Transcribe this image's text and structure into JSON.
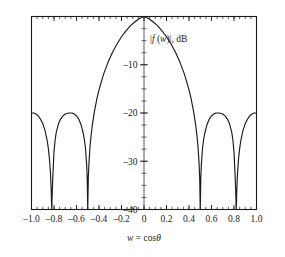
{
  "chart_data": {
    "type": "line",
    "title": "",
    "subtitle": "",
    "xlabel": "w = cosθ",
    "ylabel": "|f (w)|, dB",
    "ylabel_parts": {
      "bar_open": "|",
      "f": "f",
      "paren_open": " (",
      "w": "w",
      "paren_close": ")",
      "bar_close": "|",
      "units": ", dB"
    },
    "xlabel_parts": {
      "var": "w",
      "eq": " = cos",
      "theta": "θ"
    },
    "xlim": [
      -1.0,
      1.0
    ],
    "ylim": [
      -40,
      0
    ],
    "grid": false,
    "legend": null,
    "legend_position": "none",
    "x_ticks": [
      -1.0,
      -0.8,
      -0.6,
      -0.4,
      -0.2,
      0,
      0.2,
      0.4,
      0.6,
      0.8,
      1.0
    ],
    "x_tick_labels": [
      "–1.0",
      "–0.8",
      "–0.6",
      "–0.4",
      "–0.2",
      "0",
      "0.2",
      "0.4",
      "0.6",
      "0.8",
      "1.0"
    ],
    "x_minor_step": 0.05,
    "y_ticks": [
      -10,
      -20,
      -30,
      -40
    ],
    "y_tick_labels": [
      "–10",
      "–20",
      "–30",
      "–40"
    ],
    "y_minor_step": 2.5,
    "series": [
      {
        "name": "array factor magnitude",
        "color": "#1a1a1a",
        "peak_db": 0,
        "peak_w": 0,
        "sidelobe_level_db": -20,
        "nulls_w": [
          -0.82,
          -0.5,
          0.5,
          0.82
        ],
        "sidelobe_peaks_w": [
          -0.98,
          -0.64,
          0.64,
          0.98
        ],
        "sidelobe_peaks_db": [
          -20,
          -20,
          -20,
          -20
        ],
        "x": [
          -1.0,
          -0.98,
          -0.96,
          -0.94,
          -0.92,
          -0.9,
          -0.88,
          -0.86,
          -0.85,
          -0.84,
          -0.83,
          -0.825,
          -0.82,
          -0.815,
          -0.81,
          -0.8,
          -0.79,
          -0.78,
          -0.76,
          -0.74,
          -0.72,
          -0.7,
          -0.68,
          -0.66,
          -0.64,
          -0.62,
          -0.6,
          -0.58,
          -0.56,
          -0.54,
          -0.53,
          -0.52,
          -0.51,
          -0.505,
          -0.5,
          -0.495,
          -0.49,
          -0.48,
          -0.47,
          -0.46,
          -0.44,
          -0.42,
          -0.4,
          -0.36,
          -0.32,
          -0.28,
          -0.24,
          -0.2,
          -0.16,
          -0.12,
          -0.08,
          -0.04,
          0.0,
          0.04,
          0.08,
          0.12,
          0.16,
          0.2,
          0.24,
          0.28,
          0.32,
          0.36,
          0.4,
          0.42,
          0.44,
          0.46,
          0.47,
          0.48,
          0.49,
          0.495,
          0.5,
          0.505,
          0.51,
          0.52,
          0.53,
          0.54,
          0.56,
          0.58,
          0.6,
          0.62,
          0.64,
          0.66,
          0.68,
          0.7,
          0.72,
          0.74,
          0.76,
          0.78,
          0.79,
          0.8,
          0.81,
          0.815,
          0.82,
          0.825,
          0.83,
          0.84,
          0.85,
          0.86,
          0.88,
          0.9,
          0.92,
          0.94,
          0.96,
          0.98,
          1.0
        ],
        "y": [
          -20.0,
          -20.0,
          -20.2,
          -20.6,
          -21.3,
          -22.2,
          -23.6,
          -25.8,
          -27.4,
          -29.6,
          -33.0,
          -36.0,
          -44.0,
          -36.0,
          -33.0,
          -28.0,
          -25.6,
          -24.0,
          -22.2,
          -21.2,
          -20.6,
          -20.2,
          -20.05,
          -20.0,
          -20.0,
          -20.2,
          -20.6,
          -21.3,
          -22.4,
          -24.2,
          -25.5,
          -27.4,
          -30.6,
          -33.4,
          -44.0,
          -33.4,
          -30.6,
          -27.0,
          -24.6,
          -22.6,
          -19.6,
          -17.2,
          -15.2,
          -12.0,
          -9.5,
          -7.4,
          -5.7,
          -4.2,
          -3.0,
          -1.9,
          -1.1,
          -0.4,
          0.0,
          -0.4,
          -1.1,
          -1.9,
          -3.0,
          -4.2,
          -5.7,
          -7.4,
          -9.5,
          -12.0,
          -15.2,
          -17.2,
          -19.6,
          -22.6,
          -24.6,
          -27.0,
          -30.6,
          -33.4,
          -44.0,
          -33.4,
          -30.6,
          -27.4,
          -25.5,
          -24.2,
          -22.4,
          -21.3,
          -20.6,
          -20.2,
          -20.0,
          -20.0,
          -20.05,
          -20.2,
          -20.6,
          -21.2,
          -22.2,
          -24.0,
          -25.6,
          -28.0,
          -33.0,
          -36.0,
          -44.0,
          -36.0,
          -33.0,
          -29.6,
          -27.4,
          -25.8,
          -23.6,
          -22.2,
          -21.3,
          -20.6,
          -20.2,
          -20.0,
          -20.0
        ]
      }
    ]
  }
}
